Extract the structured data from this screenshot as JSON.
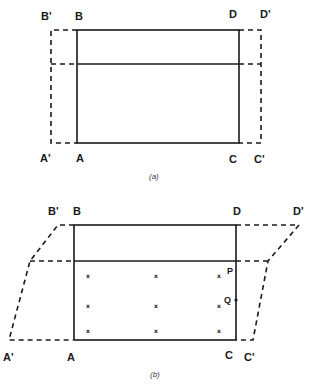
{
  "figure_a": {
    "caption": "(a)",
    "labels": {
      "B_prime": "B'",
      "B": "B",
      "D": "D",
      "D_prime": "D'",
      "A_prime": "A'",
      "A": "A",
      "C": "C",
      "C_prime": "C'"
    },
    "solid_rect": {
      "x1": 77,
      "y1": 30,
      "x2": 239,
      "y2": 143,
      "divider_y": 64
    },
    "dashed_rect": {
      "x1": 51,
      "y1": 30,
      "x2": 261,
      "y2": 143,
      "divider_y": 64
    }
  },
  "figure_b": {
    "caption": "(b)",
    "labels": {
      "B_prime": "B'",
      "B": "B",
      "D": "D",
      "D_prime": "D'",
      "A_prime": "A'",
      "A": "A",
      "C": "C",
      "C_prime": "C'",
      "P": "P",
      "Q": "Q"
    },
    "mark_glyph": "x",
    "marks": [
      {
        "x": 88,
        "y": 276
      },
      {
        "x": 156,
        "y": 276
      },
      {
        "x": 219,
        "y": 276
      },
      {
        "x": 88,
        "y": 306
      },
      {
        "x": 156,
        "y": 306
      },
      {
        "x": 219,
        "y": 306
      },
      {
        "x": 88,
        "y": 331
      },
      {
        "x": 156,
        "y": 331
      },
      {
        "x": 219,
        "y": 331
      }
    ]
  },
  "colors": {
    "line": "#1a1a1a",
    "background": "#ffffff"
  }
}
